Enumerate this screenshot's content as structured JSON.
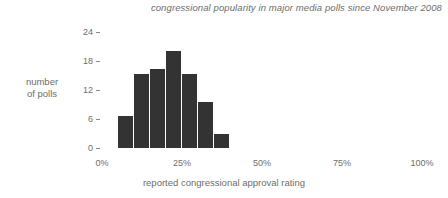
{
  "chart_data": {
    "type": "bar",
    "title": "congressional popularity in major media polls since November 2008",
    "xlabel": "reported congressional approval rating",
    "ylabel": "number of polls",
    "ylabel_lines": [
      "number",
      "of polls"
    ],
    "categories": [
      "7.5%",
      "12.5%",
      "17.5%",
      "22.5%",
      "27.5%",
      "32.5%",
      "37.5%"
    ],
    "bin_edges": [
      5,
      10,
      15,
      20,
      25,
      30,
      35,
      40
    ],
    "values": [
      7,
      16,
      17,
      21,
      16,
      10,
      3
    ],
    "xlim": [
      0,
      100
    ],
    "ylim": [
      0,
      25
    ],
    "y_ticks": [
      0,
      6,
      12,
      18,
      24
    ],
    "y_tick_labels": [
      "0",
      "6",
      "12",
      "18",
      "24"
    ],
    "x_ticks": [
      0,
      25,
      50,
      75,
      100
    ],
    "x_tick_labels": [
      "0%",
      "25%",
      "50%",
      "75%",
      "100%"
    ],
    "grid": false,
    "legend": "none",
    "bar_color": "#333333",
    "text_color": "#6d6d6d",
    "background_color": "#ffffff"
  }
}
